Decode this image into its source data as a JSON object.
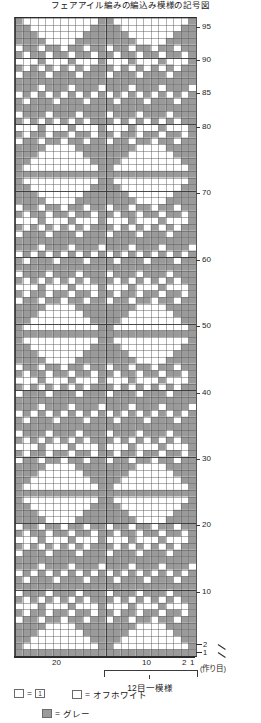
{
  "title": "フェアアイル編みの編込み模様の記号図",
  "colors": {
    "grey": "#9a9a9a",
    "offwhite": "#ffffff",
    "gridline": "#6f6f6f",
    "frame": "#2b2b2b"
  },
  "axes": {
    "row_labels": [
      "95",
      "90",
      "85",
      "80",
      "70",
      "60",
      "50",
      "40",
      "30",
      "20",
      "10",
      "2",
      "1"
    ],
    "row_values": [
      95,
      90,
      85,
      80,
      70,
      60,
      50,
      40,
      30,
      20,
      10,
      2,
      1
    ],
    "col_labels": [
      "20",
      "10",
      "2",
      "1"
    ],
    "col_values": [
      20,
      10,
      2,
      1
    ],
    "cast_on_note": "(作り目)"
  },
  "repeat": {
    "label": "12目一模様"
  },
  "legend": {
    "items": [
      {
        "swatch": "one",
        "eq": "=",
        "label": ""
      },
      {
        "swatch": "offwhite",
        "eq": "=",
        "label": "オフホワイト"
      },
      {
        "swatch": "grey",
        "eq": "=",
        "label": "グレー"
      }
    ]
  },
  "chart_data": {
    "type": "heatmap",
    "title": "フェアアイル編みの編込み模様の記号図",
    "xlabel": "目",
    "ylabel": "段",
    "cols": 24,
    "rows": 96,
    "repeat_stitches": 12,
    "value_map": {
      "0": "オフホワイト",
      "1": "グレー"
    },
    "palette": {
      "0": "#ffffff",
      "1": "#9a9a9a"
    },
    "row_order": "bottom_to_top",
    "motif_repeat_rows": 24,
    "motif_block": [
      "111111111111",
      "100000000001",
      "110000000011",
      "111000000111",
      "111100001111",
      "110110110110",
      "101101101101",
      "100010001000",
      "110101010101",
      "111011101110",
      "111111111111",
      "110111011101",
      "101010101010",
      "011101110111",
      "111111111111",
      "111011101110",
      "110101010101",
      "100010001000",
      "101101101101",
      "110110110110",
      "111100001111",
      "111000000111",
      "110000000011",
      "100000000001"
    ]
  }
}
